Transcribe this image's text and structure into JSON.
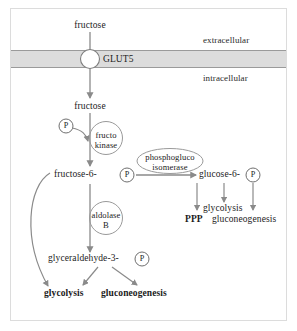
{
  "figure": {
    "compartments": {
      "extracellular": "extracellular",
      "intracellular": "intracellular"
    },
    "transporter": {
      "name": "GLUT5",
      "glyph": "transporter-circle"
    },
    "metabolites": {
      "fructose_out": "fructose",
      "fructose_in": "fructose",
      "fructose_6_p": "fructose-6-",
      "glucose_6_p": "glucose-6-",
      "glyceraldehyde_3_p": "glyceraldehyde-3-",
      "phosphate_glyph": "P"
    },
    "enzymes": {
      "fructokinase_line1": "fructo",
      "fructokinase_line2": "kinase",
      "aldolase_line1": "aldolase",
      "aldolase_line2": "B",
      "isomerase_line1": "phosphogluco",
      "isomerase_line2": "isomerase"
    },
    "outputs": {
      "ppp": "PPP",
      "glycolysis_right": "glycolysis",
      "gluconeogenesis_right": "gluconeogenesis",
      "glycolysis_bottom": "glycolysis",
      "gluconeogenesis_bottom": "gluconeogenesis"
    },
    "colors": {
      "membrane_fill": "#dcdcdc",
      "membrane_edge": "#9a9a9a",
      "arrow": "#8a8a8a",
      "text": "#1b1b1b",
      "border": "#dcdcdc",
      "circle_stroke": "#6f6f6f"
    }
  }
}
